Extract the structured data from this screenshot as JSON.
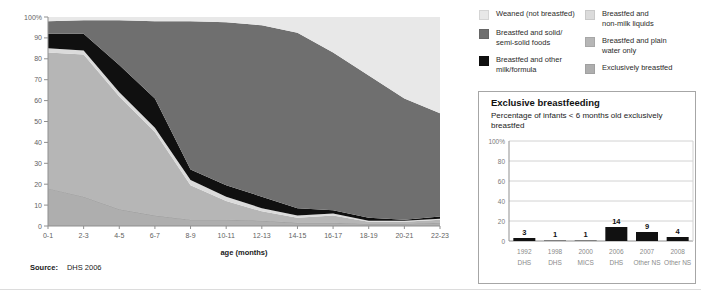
{
  "source": {
    "label": "Source:",
    "value": "DHS 2006"
  },
  "legend": {
    "items": [
      {
        "label": "Weaned (not breastfed)",
        "color": "#e8e8e8"
      },
      {
        "label": "Breastfed and solid/\nsemi-solid foods",
        "color": "#6f6f6f"
      },
      {
        "label": "Breastfed and other\nmilk/formula",
        "color": "#101010"
      },
      {
        "label": "Breastfed and\nnon-milk liquids",
        "color": "#dbdbdb"
      },
      {
        "label": "Breastfed and plain\nwater only",
        "color": "#b6b6b6"
      },
      {
        "label": "Exclusively breastfed",
        "color": "#aeaeae"
      }
    ]
  },
  "panel": {
    "title": "Exclusive breastfeeding",
    "subtitle": "Percentage of infants < 6 months old exclusively breastfed"
  },
  "chart_data": [
    {
      "type": "area",
      "stacked": true,
      "title": "",
      "xlabel": "age (months)",
      "ylabel": "",
      "ylim": [
        0,
        100
      ],
      "grid": false,
      "legend_position": "top-right",
      "source": "DHS 2006",
      "yticks": [
        0,
        10,
        20,
        30,
        40,
        50,
        60,
        70,
        80,
        90,
        100
      ],
      "ytick_labels": [
        "0",
        "10",
        "20",
        "30",
        "40",
        "50",
        "60",
        "70",
        "80",
        "90",
        "100%"
      ],
      "categories": [
        "0-1",
        "2-3",
        "4-5",
        "6-7",
        "8-9",
        "10-11",
        "12-13",
        "14-15",
        "16-17",
        "18-19",
        "20-21",
        "22-23"
      ],
      "series": [
        {
          "name": "Exclusively breastfed",
          "color": "#aeaeae",
          "edge_stroke": "#979797",
          "values": [
            18,
            14,
            8,
            5,
            3,
            3,
            2.5,
            1.5,
            1.5,
            1,
            1,
            1.5
          ]
        },
        {
          "name": "Breastfed and plain water only",
          "color": "#b6b6b6",
          "values": [
            65,
            68,
            54,
            40,
            16.5,
            9,
            4.5,
            2.5,
            3.5,
            1,
            1,
            1.5
          ]
        },
        {
          "name": "Breastfed and non-milk liquids",
          "color": "#dbdbdb",
          "values": [
            2,
            2,
            2,
            2,
            2.5,
            2,
            1.5,
            1,
            1,
            0.5,
            0.5,
            0.5
          ]
        },
        {
          "name": "Breastfed and other milk/formula",
          "color": "#101010",
          "values": [
            7,
            8,
            13,
            14,
            5,
            5.5,
            5.5,
            3.5,
            1.5,
            1.5,
            0.5,
            1
          ]
        },
        {
          "name": "Breastfed and solid/semi-solid foods",
          "color": "#6f6f6f",
          "values": [
            6,
            6.5,
            21.5,
            37,
            71,
            78,
            82,
            84,
            75.5,
            68,
            58,
            49.5
          ]
        },
        {
          "name": "Weaned (not breastfed)",
          "color": "#e8e8e8",
          "values": [
            2,
            1.5,
            1.5,
            2,
            2,
            2.5,
            4,
            7.5,
            17,
            28,
            39,
            46
          ]
        }
      ]
    },
    {
      "type": "bar",
      "title": "Exclusive breastfeeding",
      "subtitle": "Percentage of infants < 6 months old exclusively breastfed",
      "ylim": [
        0,
        100
      ],
      "grid": true,
      "yticks": [
        0,
        20,
        40,
        60,
        80,
        100
      ],
      "ytick_labels": [
        "0",
        "20",
        "40",
        "60",
        "80",
        "100%"
      ],
      "categories": [
        {
          "year": "1992",
          "survey": "DHS"
        },
        {
          "year": "1998",
          "survey": "DHS"
        },
        {
          "year": "2000",
          "survey": "MICS"
        },
        {
          "year": "2006",
          "survey": "DHS"
        },
        {
          "year": "2007",
          "survey": "Other NS"
        },
        {
          "year": "2008",
          "survey": "Other NS"
        }
      ],
      "values": [
        3,
        1,
        1,
        14,
        9,
        4
      ],
      "bar_colors": [
        "#111111",
        "#7f7f7f",
        "#7f7f7f",
        "#111111",
        "#111111",
        "#111111"
      ]
    }
  ]
}
